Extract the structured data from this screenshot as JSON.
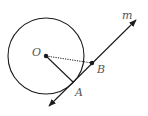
{
  "diagram": {
    "labels": {
      "center": "O",
      "tangent_point": "A",
      "point_on_line": "B",
      "line": "m"
    },
    "colors": {
      "stroke": "#1a1a1a",
      "label": "#555555"
    }
  }
}
